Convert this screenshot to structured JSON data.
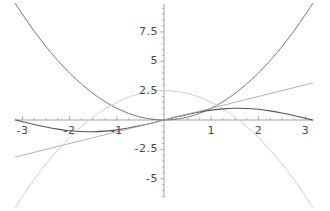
{
  "chart_data": {
    "type": "line",
    "title": "",
    "subtitle": "",
    "xlabel": "",
    "ylabel": "",
    "xlim": [
      -3.15,
      3.15
    ],
    "ylim": [
      -6.6,
      9.9
    ],
    "grid": false,
    "legend_position": "none",
    "x_ticks": [
      {
        "value": -3,
        "label": "-3"
      },
      {
        "value": -2,
        "label": "-2"
      },
      {
        "value": -1,
        "label": "-1"
      },
      {
        "value": 1,
        "label": "1"
      },
      {
        "value": 2,
        "label": "2"
      },
      {
        "value": 3,
        "label": "3"
      }
    ],
    "y_ticks": [
      {
        "value": 7.5,
        "label": "7.5"
      },
      {
        "value": 5,
        "label": "5"
      },
      {
        "value": 2.5,
        "label": "2.5"
      },
      {
        "value": -2.5,
        "label": "-2.5"
      },
      {
        "value": -5,
        "label": "-5"
      }
    ],
    "x_minor_tick_step": 0.25,
    "y_minor_tick_step": 0.5,
    "axis_color": "#9a9aa2",
    "series": [
      {
        "name": "upward-parabola",
        "color": "#6b6b73",
        "width": 0.9,
        "formula": "x^2",
        "x": [
          -3.15,
          -3,
          -2.75,
          -2.5,
          -2.25,
          -2,
          -1.75,
          -1.5,
          -1.25,
          -1,
          -0.75,
          -0.5,
          -0.25,
          0,
          0.25,
          0.5,
          0.75,
          1,
          1.25,
          1.5,
          1.75,
          2,
          2.25,
          2.5,
          2.75,
          3,
          3.15
        ],
        "y": [
          9.9225,
          9,
          7.5625,
          6.25,
          5.0625,
          4,
          3.0625,
          2.25,
          1.5625,
          1,
          0.5625,
          0.25,
          0.0625,
          0,
          0.0625,
          0.25,
          0.5625,
          1,
          1.5625,
          2.25,
          3.0625,
          4,
          5.0625,
          6.25,
          7.5625,
          9,
          9.9225
        ]
      },
      {
        "name": "downward-parabola-light",
        "color": "#c8c8ce",
        "width": 0.9,
        "formula": "2.5 - x^2",
        "x": [
          -3.15,
          -3,
          -2.75,
          -2.5,
          -2.25,
          -2,
          -1.75,
          -1.5,
          -1.25,
          -1,
          -0.75,
          -0.5,
          -0.25,
          0,
          0.25,
          0.5,
          0.75,
          1,
          1.25,
          1.5,
          1.75,
          2,
          2.25,
          2.5,
          2.75,
          3,
          3.15
        ],
        "y": [
          -7.4225,
          -6.5,
          -5.0625,
          -3.75,
          -2.5625,
          -1.5,
          -0.5625,
          0.25,
          0.9375,
          1.5,
          1.9375,
          2.25,
          2.4375,
          2.5,
          2.4375,
          2.25,
          1.9375,
          1.5,
          0.9375,
          0.25,
          -0.5625,
          -1.5,
          -2.5625,
          -3.75,
          -5.0625,
          -6.5,
          -7.4225
        ]
      },
      {
        "name": "sine-wave-dark",
        "color": "#55555d",
        "width": 1.1,
        "formula": "sin(x)",
        "x": [
          -3.15,
          -3,
          -2.75,
          -2.5,
          -2.25,
          -2,
          -1.75,
          -1.5,
          -1.25,
          -1,
          -0.75,
          -0.5,
          -0.25,
          0,
          0.25,
          0.5,
          0.75,
          1,
          1.25,
          1.5,
          1.75,
          2,
          2.25,
          2.5,
          2.75,
          3,
          3.15
        ],
        "y": [
          0.0084,
          -0.1411,
          -0.3817,
          -0.5985,
          -0.7781,
          -0.9093,
          -0.9839,
          -0.9975,
          -0.949,
          -0.8415,
          -0.6816,
          -0.4794,
          -0.2474,
          0,
          0.2474,
          0.4794,
          0.6816,
          0.8415,
          0.949,
          0.9975,
          0.9839,
          0.9093,
          0.7781,
          0.5985,
          0.3817,
          0.1411,
          -0.0084
        ]
      },
      {
        "name": "straight-line",
        "color": "#a8a8b0",
        "width": 0.9,
        "formula": "x",
        "x": [
          -3.15,
          3.15
        ],
        "y": [
          -3.15,
          3.15
        ]
      }
    ]
  },
  "axes": {
    "x_axis_name": "horizontal-axis",
    "y_axis_name": "vertical-axis"
  }
}
